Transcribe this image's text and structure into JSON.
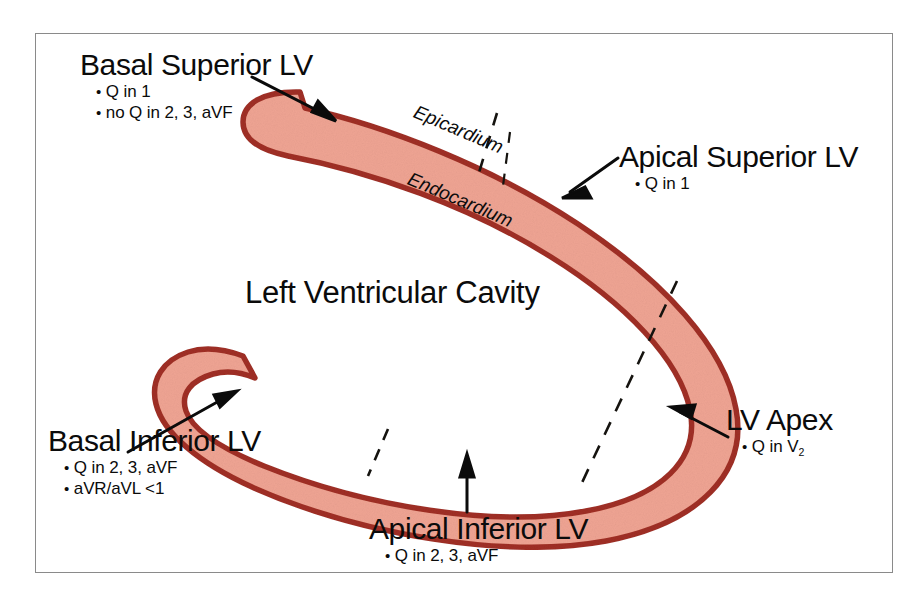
{
  "figure": {
    "frame_border_color": "#8a8a8a",
    "background": "#ffffff",
    "myocardium_fill": "#efa493",
    "myocardium_stroke": "#a03025",
    "annotation_color": "#0b0b0b"
  },
  "cavity_label": "Left Ventricular Cavity",
  "wall_annotations": [
    {
      "id": "epicardium",
      "text": "Epicardium"
    },
    {
      "id": "endocardium",
      "text": "Endocardium"
    }
  ],
  "regions": [
    {
      "id": "basal-superior-lv",
      "title": "Basal Superior LV",
      "bullets": [
        "Q in 1",
        "no Q in 2, 3, aVF"
      ]
    },
    {
      "id": "apical-superior-lv",
      "title": "Apical Superior LV",
      "bullets": [
        "Q in 1"
      ]
    },
    {
      "id": "lv-apex",
      "title": "LV Apex",
      "bullets": [
        "Q in V2"
      ],
      "bullets_sub": [
        {
          "base": "Q in V",
          "sub": "2"
        }
      ]
    },
    {
      "id": "apical-inferior-lv",
      "title": "Apical Inferior LV",
      "bullets": [
        "Q in 2, 3, aVF"
      ]
    },
    {
      "id": "basal-inferior-lv",
      "title": "Basal Inferior LV",
      "bullets": [
        "Q in 2, 3, aVF",
        "aVR/aVL <1"
      ]
    }
  ],
  "bullet_glyph": "•"
}
